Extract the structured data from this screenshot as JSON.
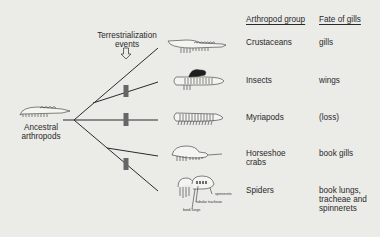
{
  "headers": {
    "group": "Arthropod group",
    "fate": "Fate of gills"
  },
  "event_label": {
    "line1": "Terrestrialization",
    "line2": "events"
  },
  "ancestor_label": {
    "line1": "Ancestral",
    "line2": "arthropods"
  },
  "rows": [
    {
      "group": "Crustaceans",
      "fate": [
        "gills"
      ],
      "terrestrial": false
    },
    {
      "group": "Insects",
      "fate": [
        "wings"
      ],
      "terrestrial": true
    },
    {
      "group": "Myriapods",
      "fate": [
        "(loss)"
      ],
      "terrestrial": true
    },
    {
      "group": [
        "Horseshoe",
        "crabs"
      ],
      "fate": [
        "book gills"
      ],
      "terrestrial": false
    },
    {
      "group": "Spiders",
      "fate": [
        "book lungs,",
        "tracheae and",
        "spinnerets"
      ],
      "terrestrial": true
    }
  ],
  "spider_annotations": [
    "spinnerets",
    "tubular tracheae",
    "book lungs"
  ],
  "colors": {
    "background": "#ebebe8",
    "line": "#2a2a2a",
    "marker": "#666666"
  }
}
